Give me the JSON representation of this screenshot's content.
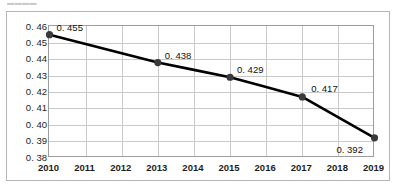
{
  "page": {
    "top_cut_text": "▬▬▬▬",
    "background_color": "#ffffff"
  },
  "style": {
    "line_color": "#000000",
    "marker_color": "#3a3a3a",
    "gridline_color": "#c9c9c9",
    "frame_color": "#9d9d9d",
    "text_color": "#1d1d1d"
  },
  "chart_data": {
    "type": "line",
    "title": "",
    "subtitle": "",
    "xlabel": "",
    "ylabel": "",
    "categories": [
      "2010",
      "2011",
      "2012",
      "2013",
      "2014",
      "2015",
      "2016",
      "2017",
      "2018",
      "2019"
    ],
    "x": [
      2010,
      2011,
      2012,
      2013,
      2014,
      2015,
      2016,
      2017,
      2018,
      2019
    ],
    "series": [
      {
        "name": "",
        "values": [
          0.455,
          0.4493,
          0.4437,
          0.438,
          0.4335,
          0.429,
          0.423,
          0.417,
          0.4045,
          0.392
        ]
      }
    ],
    "labeled_points": [
      {
        "x": "2010",
        "y": 0.455,
        "label": "0. 455"
      },
      {
        "x": "2013",
        "y": 0.438,
        "label": "0. 438"
      },
      {
        "x": "2015",
        "y": 0.429,
        "label": "0. 429"
      },
      {
        "x": "2017",
        "y": 0.417,
        "label": "0. 417"
      },
      {
        "x": "2019",
        "y": 0.392,
        "label": "0. 392"
      }
    ],
    "ylim": [
      0.38,
      0.46
    ],
    "ytick_step": 0.01,
    "ytick_labels": [
      "0. 46",
      "0. 45",
      "0. 44",
      "0. 43",
      "0. 42",
      "0. 41",
      "0. 40",
      "0. 39",
      "0. 38"
    ],
    "ytick_values": [
      0.46,
      0.45,
      0.44,
      0.43,
      0.42,
      0.41,
      0.4,
      0.39,
      0.38
    ],
    "grid": true,
    "legend": false,
    "legend_position": "none",
    "markers": true,
    "marker_shape": "circle"
  }
}
